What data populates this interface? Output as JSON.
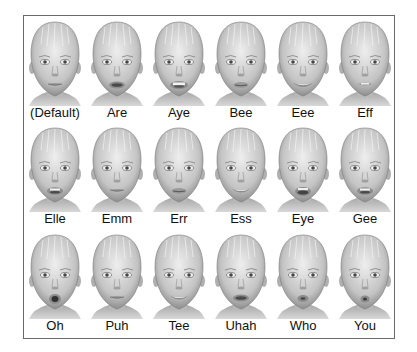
{
  "colors": {
    "frame_border": "#6a6a6a",
    "skin_light": "#e6e6e6",
    "skin_mid": "#bdbdbd",
    "skin_dark": "#8a8a8a",
    "text": "#111111"
  },
  "rows": [
    [
      {
        "label": "(Default)",
        "mouth": "closed"
      },
      {
        "label": "Are",
        "mouth": "open"
      },
      {
        "label": "Aye",
        "mouth": "wide-teeth"
      },
      {
        "label": "Bee",
        "mouth": "slight"
      },
      {
        "label": "Eee",
        "mouth": "smile-wide"
      },
      {
        "label": "Eff",
        "mouth": "bite"
      }
    ],
    [
      {
        "label": "Elle",
        "mouth": "open-teeth"
      },
      {
        "label": "Emm",
        "mouth": "closed"
      },
      {
        "label": "Err",
        "mouth": "slight"
      },
      {
        "label": "Ess",
        "mouth": "smile-teeth"
      },
      {
        "label": "Eye",
        "mouth": "open-wide"
      },
      {
        "label": "Gee",
        "mouth": "open-teeth"
      }
    ],
    [
      {
        "label": "Oh",
        "mouth": "round"
      },
      {
        "label": "Puh",
        "mouth": "closed"
      },
      {
        "label": "Tee",
        "mouth": "smile-teeth"
      },
      {
        "label": "Uhah",
        "mouth": "open"
      },
      {
        "label": "Who",
        "mouth": "pucker"
      },
      {
        "label": "You",
        "mouth": "pucker-small"
      }
    ]
  ]
}
